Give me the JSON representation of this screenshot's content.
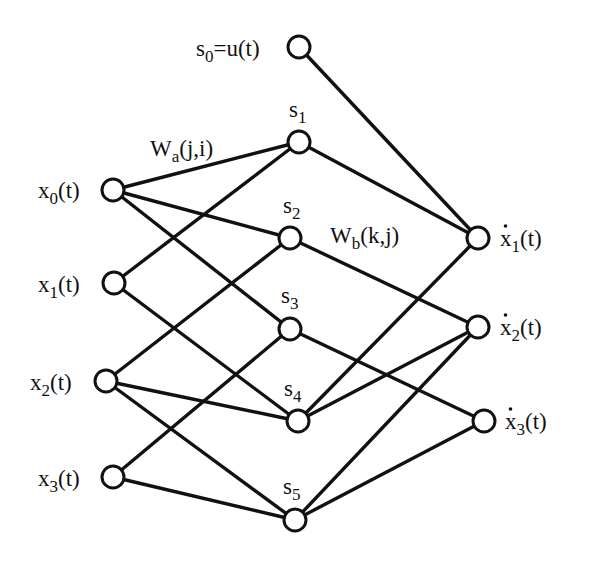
{
  "diagram": {
    "type": "neural-network",
    "colors": {
      "line": "#111111",
      "node_fill": "#ffffff",
      "background": "#ffffff"
    },
    "weight_labels": {
      "wa": {
        "base": "W",
        "sub": "a",
        "args": "(j,i)",
        "x": 150,
        "y": 156
      },
      "wb": {
        "base": "W",
        "sub": "b",
        "args": "(k,j)",
        "x": 330,
        "y": 243
      }
    },
    "nodes": [
      {
        "id": "s0",
        "layer": "bias",
        "x": 299,
        "y": 47,
        "label_parts": [
          "s",
          "0",
          "=u(t)"
        ],
        "label_x": 196,
        "label_y": 56,
        "anchor": "start",
        "dot": false
      },
      {
        "id": "x0",
        "layer": "input",
        "x": 113,
        "y": 190,
        "label_parts": [
          "x",
          "0",
          "(t)"
        ],
        "label_x": 38,
        "label_y": 198,
        "anchor": "start",
        "dot": false
      },
      {
        "id": "x1",
        "layer": "input",
        "x": 114,
        "y": 283,
        "label_parts": [
          "x",
          "1",
          "(t)"
        ],
        "label_x": 38,
        "label_y": 292,
        "anchor": "start",
        "dot": false
      },
      {
        "id": "x2",
        "layer": "input",
        "x": 106,
        "y": 381,
        "label_parts": [
          "x",
          "2",
          "(t)"
        ],
        "label_x": 30,
        "label_y": 390,
        "anchor": "start",
        "dot": false
      },
      {
        "id": "x3",
        "layer": "input",
        "x": 113,
        "y": 477,
        "label_parts": [
          "x",
          "3",
          "(t)"
        ],
        "label_x": 38,
        "label_y": 486,
        "anchor": "start",
        "dot": false
      },
      {
        "id": "s1",
        "layer": "hidden",
        "x": 299,
        "y": 142,
        "label_parts": [
          "s",
          "1",
          ""
        ],
        "label_x": 289,
        "label_y": 117,
        "anchor": "start",
        "dot": false
      },
      {
        "id": "s2",
        "layer": "hidden",
        "x": 290,
        "y": 238,
        "label_parts": [
          "s",
          "2",
          ""
        ],
        "label_x": 283,
        "label_y": 213,
        "anchor": "start",
        "dot": false
      },
      {
        "id": "s3",
        "layer": "hidden",
        "x": 290,
        "y": 329,
        "label_parts": [
          "s",
          "3",
          ""
        ],
        "label_x": 281,
        "label_y": 303,
        "anchor": "start",
        "dot": false
      },
      {
        "id": "s4",
        "layer": "hidden",
        "x": 298,
        "y": 421,
        "label_parts": [
          "s",
          "4",
          ""
        ],
        "label_x": 284,
        "label_y": 396,
        "anchor": "start",
        "dot": false
      },
      {
        "id": "s5",
        "layer": "hidden",
        "x": 295,
        "y": 520,
        "label_parts": [
          "s",
          "5",
          ""
        ],
        "label_x": 283,
        "label_y": 494,
        "anchor": "start",
        "dot": false
      },
      {
        "id": "xd1",
        "layer": "output",
        "x": 478,
        "y": 238,
        "label_parts": [
          "x",
          "1",
          "(t)"
        ],
        "label_x": 500,
        "label_y": 246,
        "anchor": "start",
        "dot": true
      },
      {
        "id": "xd2",
        "layer": "output",
        "x": 478,
        "y": 327,
        "label_parts": [
          "x",
          "2",
          "(t)"
        ],
        "label_x": 500,
        "label_y": 335,
        "anchor": "start",
        "dot": true
      },
      {
        "id": "xd3",
        "layer": "output",
        "x": 484,
        "y": 421,
        "label_parts": [
          "x",
          "3",
          "(t)"
        ],
        "label_x": 505,
        "label_y": 429,
        "anchor": "start",
        "dot": true
      }
    ],
    "edges": [
      [
        "x0",
        "s1"
      ],
      [
        "x0",
        "s2"
      ],
      [
        "x0",
        "s3"
      ],
      [
        "x1",
        "s1"
      ],
      [
        "x1",
        "s4"
      ],
      [
        "x2",
        "s2"
      ],
      [
        "x2",
        "s4"
      ],
      [
        "x2",
        "s5"
      ],
      [
        "x3",
        "s3"
      ],
      [
        "x3",
        "s5"
      ],
      [
        "s0",
        "xd1"
      ],
      [
        "s1",
        "xd1"
      ],
      [
        "s4",
        "xd1"
      ],
      [
        "s2",
        "xd2"
      ],
      [
        "s4",
        "xd2"
      ],
      [
        "s5",
        "xd2"
      ],
      [
        "s3",
        "xd3"
      ],
      [
        "s5",
        "xd3"
      ]
    ],
    "node_radius": 11
  }
}
